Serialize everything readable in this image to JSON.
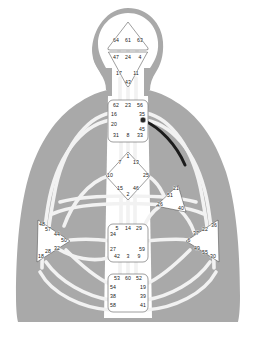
{
  "document": {
    "title": "Human Design BodyGraph",
    "type": "bodygraph-diagram"
  },
  "chart_data": {
    "type": "diagram",
    "subtitle": "Nine centers with 64 gate numbers",
    "centers": [
      {
        "id": "head",
        "name": "Head Center",
        "shape": "triangle-up",
        "defined": false,
        "gates": [
          {
            "num": "64",
            "x": 116,
            "y": 41
          },
          {
            "num": "61",
            "x": 128,
            "y": 41
          },
          {
            "num": "63",
            "x": 140,
            "y": 41
          }
        ]
      },
      {
        "id": "ajna",
        "name": "Ajna Center",
        "shape": "triangle-down",
        "defined": false,
        "gates": [
          {
            "num": "47",
            "x": 116,
            "y": 58
          },
          {
            "num": "24",
            "x": 128,
            "y": 58
          },
          {
            "num": "4",
            "x": 140,
            "y": 58
          },
          {
            "num": "17",
            "x": 119,
            "y": 74
          },
          {
            "num": "11",
            "x": 136,
            "y": 74
          },
          {
            "num": "43",
            "x": 128,
            "y": 83
          }
        ]
      },
      {
        "id": "throat",
        "name": "Throat Center",
        "shape": "square",
        "defined": false,
        "gates": [
          {
            "num": "62",
            "x": 116,
            "y": 106
          },
          {
            "num": "23",
            "x": 128,
            "y": 106
          },
          {
            "num": "56",
            "x": 140,
            "y": 106
          },
          {
            "num": "16",
            "x": 114,
            "y": 115
          },
          {
            "num": "20",
            "x": 114,
            "y": 125
          },
          {
            "num": "35",
            "x": 142,
            "y": 115
          },
          {
            "num": "12",
            "x": 143,
            "y": 121
          },
          {
            "num": "45",
            "x": 142,
            "y": 130
          },
          {
            "num": "31",
            "x": 116,
            "y": 136
          },
          {
            "num": "8",
            "x": 128,
            "y": 136
          },
          {
            "num": "33",
            "x": 140,
            "y": 136
          }
        ]
      },
      {
        "id": "g-center",
        "name": "G Center",
        "shape": "diamond",
        "defined": false,
        "gates": [
          {
            "num": "1",
            "x": 128,
            "y": 157
          },
          {
            "num": "7",
            "x": 120,
            "y": 163
          },
          {
            "num": "13",
            "x": 136,
            "y": 163
          },
          {
            "num": "10",
            "x": 110,
            "y": 176
          },
          {
            "num": "25",
            "x": 146,
            "y": 176
          },
          {
            "num": "15",
            "x": 120,
            "y": 189
          },
          {
            "num": "46",
            "x": 136,
            "y": 189
          },
          {
            "num": "2",
            "x": 128,
            "y": 195
          }
        ]
      },
      {
        "id": "heart",
        "name": "Heart / Ego Center",
        "shape": "triangle-right",
        "defined": false,
        "gates": [
          {
            "num": "21",
            "x": 176,
            "y": 189
          },
          {
            "num": "51",
            "x": 170,
            "y": 196
          },
          {
            "num": "26",
            "x": 160,
            "y": 205
          },
          {
            "num": "40",
            "x": 181,
            "y": 209
          }
        ]
      },
      {
        "id": "spleen",
        "name": "Spleen Center",
        "shape": "triangle-left",
        "defined": false,
        "gates": [
          {
            "num": "48",
            "x": 42,
            "y": 225
          },
          {
            "num": "57",
            "x": 48,
            "y": 230
          },
          {
            "num": "44",
            "x": 57,
            "y": 235
          },
          {
            "num": "50",
            "x": 64,
            "y": 241
          },
          {
            "num": "32",
            "x": 57,
            "y": 249
          },
          {
            "num": "28",
            "x": 48,
            "y": 252
          },
          {
            "num": "18",
            "x": 41,
            "y": 257
          }
        ]
      },
      {
        "id": "solar-plexus",
        "name": "Solar Plexus Center",
        "shape": "triangle-right",
        "defined": false,
        "gates": [
          {
            "num": "22",
            "x": 205,
            "y": 230
          },
          {
            "num": "36",
            "x": 214,
            "y": 226
          },
          {
            "num": "37",
            "x": 196,
            "y": 234
          },
          {
            "num": "6",
            "x": 189,
            "y": 241
          },
          {
            "num": "49",
            "x": 197,
            "y": 249
          },
          {
            "num": "55",
            "x": 205,
            "y": 253
          },
          {
            "num": "30",
            "x": 213,
            "y": 257
          }
        ]
      },
      {
        "id": "sacral",
        "name": "Sacral Center",
        "shape": "square",
        "defined": false,
        "gates": [
          {
            "num": "5",
            "x": 117,
            "y": 229
          },
          {
            "num": "14",
            "x": 128,
            "y": 229
          },
          {
            "num": "29",
            "x": 139,
            "y": 229
          },
          {
            "num": "34",
            "x": 113,
            "y": 235
          },
          {
            "num": "27",
            "x": 113,
            "y": 250
          },
          {
            "num": "59",
            "x": 142,
            "y": 250
          },
          {
            "num": "42",
            "x": 117,
            "y": 257
          },
          {
            "num": "3",
            "x": 128,
            "y": 257
          },
          {
            "num": "9",
            "x": 139,
            "y": 257
          }
        ]
      },
      {
        "id": "root",
        "name": "Root Center",
        "shape": "square",
        "defined": false,
        "gates": [
          {
            "num": "53",
            "x": 117,
            "y": 279
          },
          {
            "num": "60",
            "x": 128,
            "y": 279
          },
          {
            "num": "52",
            "x": 139,
            "y": 279
          },
          {
            "num": "54",
            "x": 113,
            "y": 288
          },
          {
            "num": "19",
            "x": 143,
            "y": 288
          },
          {
            "num": "38",
            "x": 113,
            "y": 297
          },
          {
            "num": "39",
            "x": 143,
            "y": 297
          },
          {
            "num": "58",
            "x": 113,
            "y": 306
          },
          {
            "num": "41",
            "x": 143,
            "y": 306
          }
        ]
      }
    ],
    "activations": [
      {
        "gate": "12",
        "x": 143,
        "y": 120,
        "style": "filled-dot",
        "color": "#262626",
        "note": "single activated gate with dark channel arc"
      }
    ],
    "colors": {
      "body": "#a9a9a9",
      "channel": "#f3f3f3",
      "center_fill": "#ffffff",
      "center_stroke": "#4d4d4d",
      "active_channel": "#1c1c1c",
      "label_text": "#1a1a1a",
      "background": "#ffffff"
    }
  }
}
